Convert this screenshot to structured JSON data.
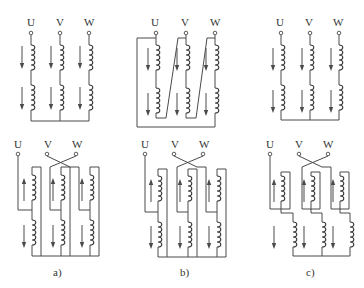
{
  "figure": {
    "terminals": [
      "U",
      "V",
      "W"
    ],
    "panels": [
      {
        "id": "a",
        "caption": "a)"
      },
      {
        "id": "b",
        "caption": "b)"
      },
      {
        "id": "c",
        "caption": "c)"
      }
    ],
    "top_row": {
      "description": "Three-phase windings, each with two series coil groups, currents pointing down",
      "arrow_direction": [
        "down",
        "down"
      ]
    },
    "bottom_row": {
      "description": "Reconnected windings with V/W crossover, upper coil current up, lower coil current down",
      "arrow_direction": [
        "up",
        "down"
      ]
    }
  }
}
